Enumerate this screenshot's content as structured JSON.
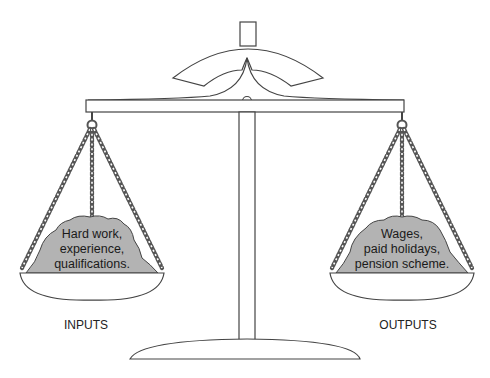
{
  "diagram": {
    "type": "balance-scale",
    "left_pan": {
      "pile_lines": [
        "Hard work,",
        "experience,",
        "qualifications."
      ],
      "label": "INPUTS"
    },
    "right_pan": {
      "pile_lines": [
        "Wages,",
        "paid holidays,",
        "pension scheme."
      ],
      "label": "OUTPUTS"
    },
    "colors": {
      "line": "#444444",
      "pile_fill": "#b3b3b3",
      "background": "#ffffff"
    }
  }
}
